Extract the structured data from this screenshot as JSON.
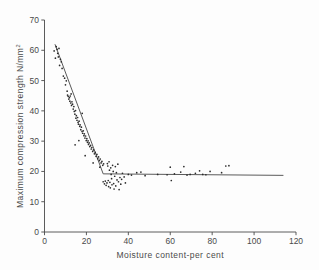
{
  "figure": {
    "background": "#fdfdfd",
    "ink_color": "#4a4a4a",
    "point_color": "#2b2b2b",
    "line_color": "#5a5a5a"
  },
  "chart_data": {
    "type": "scatter",
    "title": "",
    "xlabel": "Moisture content-per cent",
    "ylabel": "Maximum compression strength  N/mm",
    "ylabel_superscript": "2",
    "xlim": [
      0,
      120
    ],
    "ylim": [
      0,
      70
    ],
    "xticks": [
      0,
      20,
      40,
      60,
      80,
      100,
      120
    ],
    "yticks": [
      0,
      10,
      20,
      30,
      40,
      50,
      60,
      70
    ],
    "xtick_labels": [
      "0",
      "20",
      "40",
      "60",
      "80",
      "100",
      "120"
    ],
    "ytick_labels": [
      "0",
      "10",
      "20",
      "30",
      "40",
      "50",
      "60",
      "70"
    ],
    "grid": false,
    "legend": null,
    "annotations": [],
    "fit_line": {
      "name": "bilinear trend",
      "description": "steep linear decline to a knee, then horizontal plateau",
      "points": [
        [
          5.0,
          62.0
        ],
        [
          28.0,
          19.2
        ],
        [
          114.0,
          18.7
        ]
      ],
      "knee_x": 28.0,
      "plateau_y": 18.7
    },
    "points": [
      [
        4.6,
        59.8
      ],
      [
        5.2,
        57.4
      ],
      [
        5.6,
        61.2
      ],
      [
        6.0,
        60.3
      ],
      [
        6.3,
        59.0
      ],
      [
        6.6,
        57.8
      ],
      [
        6.9,
        60.6
      ],
      [
        7.2,
        55.0
      ],
      [
        7.6,
        57.0
      ],
      [
        8.0,
        56.2
      ],
      [
        8.4,
        54.0
      ],
      [
        9.0,
        51.5
      ],
      [
        9.6,
        50.8
      ],
      [
        10.0,
        48.6
      ],
      [
        10.4,
        49.9
      ],
      [
        10.8,
        46.5
      ],
      [
        11.0,
        45.2
      ],
      [
        11.3,
        44.8
      ],
      [
        11.6,
        43.9
      ],
      [
        11.9,
        44.4
      ],
      [
        12.1,
        43.2
      ],
      [
        12.3,
        44.9
      ],
      [
        12.5,
        42.6
      ],
      [
        12.7,
        45.6
      ],
      [
        12.9,
        41.8
      ],
      [
        13.1,
        43.0
      ],
      [
        13.4,
        42.2
      ],
      [
        13.7,
        40.6
      ],
      [
        14.0,
        41.4
      ],
      [
        14.2,
        39.8
      ],
      [
        14.5,
        38.9
      ],
      [
        14.8,
        40.1
      ],
      [
        15.0,
        37.6
      ],
      [
        15.2,
        38.4
      ],
      [
        15.5,
        36.9
      ],
      [
        15.8,
        37.8
      ],
      [
        16.0,
        36.2
      ],
      [
        16.2,
        35.6
      ],
      [
        16.5,
        36.6
      ],
      [
        16.8,
        34.9
      ],
      [
        17.0,
        35.4
      ],
      [
        17.3,
        33.8
      ],
      [
        17.6,
        34.6
      ],
      [
        17.9,
        33.2
      ],
      [
        18.0,
        39.2
      ],
      [
        18.2,
        32.6
      ],
      [
        18.5,
        33.4
      ],
      [
        18.8,
        31.8
      ],
      [
        19.0,
        32.4
      ],
      [
        19.3,
        31.0
      ],
      [
        19.6,
        31.7
      ],
      [
        19.9,
        30.2
      ],
      [
        20.2,
        30.8
      ],
      [
        20.5,
        29.6
      ],
      [
        20.8,
        30.1
      ],
      [
        21.0,
        28.9
      ],
      [
        21.3,
        29.4
      ],
      [
        21.6,
        28.2
      ],
      [
        22.0,
        28.6
      ],
      [
        22.3,
        27.4
      ],
      [
        22.6,
        27.9
      ],
      [
        23.0,
        26.6
      ],
      [
        23.4,
        27.1
      ],
      [
        23.8,
        25.8
      ],
      [
        24.2,
        26.3
      ],
      [
        24.6,
        25.0
      ],
      [
        25.0,
        25.6
      ],
      [
        25.4,
        24.2
      ],
      [
        25.8,
        24.8
      ],
      [
        26.2,
        23.6
      ],
      [
        26.6,
        24.1
      ],
      [
        27.0,
        22.8
      ],
      [
        27.4,
        23.3
      ],
      [
        27.8,
        22.0
      ],
      [
        28.2,
        22.5
      ],
      [
        14.6,
        28.8
      ],
      [
        16.4,
        30.2
      ],
      [
        19.4,
        25.2
      ],
      [
        23.2,
        22.8
      ],
      [
        26.4,
        21.4
      ],
      [
        28.0,
        16.6
      ],
      [
        28.6,
        15.9
      ],
      [
        29.0,
        16.8
      ],
      [
        29.4,
        15.4
      ],
      [
        29.8,
        16.2
      ],
      [
        30.0,
        22.6
      ],
      [
        30.2,
        21.8
      ],
      [
        30.4,
        17.0
      ],
      [
        30.6,
        15.0
      ],
      [
        30.8,
        23.2
      ],
      [
        31.0,
        20.4
      ],
      [
        31.2,
        16.4
      ],
      [
        31.4,
        14.6
      ],
      [
        31.6,
        21.2
      ],
      [
        31.8,
        19.0
      ],
      [
        32.0,
        17.6
      ],
      [
        32.2,
        15.6
      ],
      [
        32.5,
        22.0
      ],
      [
        32.8,
        20.0
      ],
      [
        33.0,
        16.0
      ],
      [
        33.2,
        14.2
      ],
      [
        33.5,
        18.4
      ],
      [
        33.8,
        21.6
      ],
      [
        34.0,
        15.2
      ],
      [
        34.3,
        19.6
      ],
      [
        34.6,
        17.2
      ],
      [
        35.0,
        22.4
      ],
      [
        35.3,
        16.6
      ],
      [
        35.6,
        14.0
      ],
      [
        36.0,
        18.0
      ],
      [
        36.4,
        15.8
      ],
      [
        36.8,
        17.4
      ],
      [
        37.2,
        19.4
      ],
      [
        38.0,
        18.2
      ],
      [
        38.6,
        16.2
      ],
      [
        40.0,
        19.0
      ],
      [
        41.5,
        18.8
      ],
      [
        44.0,
        19.6
      ],
      [
        46.0,
        19.8
      ],
      [
        48.0,
        18.6
      ],
      [
        54.0,
        19.0
      ],
      [
        58.5,
        18.9
      ],
      [
        60.0,
        21.4
      ],
      [
        60.5,
        17.0
      ],
      [
        62.0,
        19.2
      ],
      [
        65.0,
        19.8
      ],
      [
        66.5,
        21.6
      ],
      [
        68.0,
        18.8
      ],
      [
        69.5,
        19.0
      ],
      [
        72.0,
        19.4
      ],
      [
        74.0,
        20.2
      ],
      [
        75.5,
        19.0
      ],
      [
        77.0,
        18.9
      ],
      [
        79.0,
        20.0
      ],
      [
        84.5,
        19.6
      ],
      [
        86.5,
        21.8
      ],
      [
        88.0,
        21.9
      ]
    ]
  }
}
